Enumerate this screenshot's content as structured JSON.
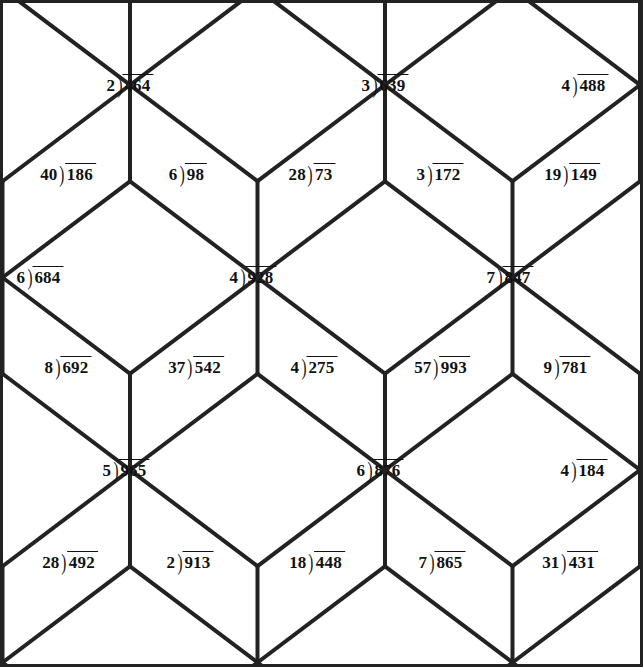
{
  "page": {
    "background_color": "#ffffff",
    "line_color": "#222222",
    "text_color": "#111111",
    "width": 643,
    "height": 667
  },
  "tiling": {
    "type": "rhombille",
    "description": "Cube / rhombille tessellation of 60-120 degree rhombi",
    "hub_spacing_x": 255,
    "hub_spacing_y": 192.5,
    "hub_rows_y": [
      -107.5,
      85,
      277.5,
      470,
      662.5
    ],
    "hub_cols_x": [
      3,
      130,
      258,
      385,
      513,
      640
    ],
    "border_width": 3,
    "line_width": 4
  },
  "problems": [
    {
      "id": "p1",
      "divisor": "2",
      "dividend": "464",
      "x": 130,
      "y": 85,
      "row": 1,
      "col": 1
    },
    {
      "id": "p2",
      "divisor": "3",
      "dividend": "639",
      "x": 385,
      "y": 85,
      "row": 1,
      "col": 2
    },
    {
      "id": "p3",
      "divisor": "4",
      "dividend": "488",
      "x": 585,
      "y": 85,
      "row": 1,
      "col": 3
    },
    {
      "id": "p4",
      "divisor": "40",
      "dividend": "186",
      "x": 68,
      "y": 174,
      "row": 2,
      "col": 1
    },
    {
      "id": "p5",
      "divisor": "6",
      "dividend": "98",
      "x": 188,
      "y": 174,
      "row": 2,
      "col": 2
    },
    {
      "id": "p6",
      "divisor": "28",
      "dividend": "73",
      "x": 312,
      "y": 174,
      "row": 2,
      "col": 3
    },
    {
      "id": "p7",
      "divisor": "3",
      "dividend": "172",
      "x": 440,
      "y": 174,
      "row": 2,
      "col": 4
    },
    {
      "id": "p8",
      "divisor": "19",
      "dividend": "149",
      "x": 572,
      "y": 174,
      "row": 2,
      "col": 5
    },
    {
      "id": "p9",
      "divisor": "6",
      "dividend": "684",
      "x": 40,
      "y": 277,
      "row": 3,
      "col": 1
    },
    {
      "id": "p10",
      "divisor": "4",
      "dividend": "928",
      "x": 253,
      "y": 277,
      "row": 3,
      "col": 2
    },
    {
      "id": "p11",
      "divisor": "7",
      "dividend": "847",
      "x": 510,
      "y": 277,
      "row": 3,
      "col": 3
    },
    {
      "id": "p12",
      "divisor": "8",
      "dividend": "692",
      "x": 68,
      "y": 367,
      "row": 4,
      "col": 1
    },
    {
      "id": "p13",
      "divisor": "37",
      "dividend": "542",
      "x": 196,
      "y": 367,
      "row": 4,
      "col": 2
    },
    {
      "id": "p14",
      "divisor": "4",
      "dividend": "275",
      "x": 314,
      "y": 367,
      "row": 4,
      "col": 3
    },
    {
      "id": "p15",
      "divisor": "57",
      "dividend": "993",
      "x": 442,
      "y": 367,
      "row": 4,
      "col": 4
    },
    {
      "id": "p16",
      "divisor": "9",
      "dividend": "781",
      "x": 567,
      "y": 367,
      "row": 4,
      "col": 5
    },
    {
      "id": "p17",
      "divisor": "5",
      "dividend": "965",
      "x": 126,
      "y": 470,
      "row": 5,
      "col": 1
    },
    {
      "id": "p18",
      "divisor": "6",
      "dividend": "876",
      "x": 380,
      "y": 470,
      "row": 5,
      "col": 2
    },
    {
      "id": "p19",
      "divisor": "4",
      "dividend": "184",
      "x": 584,
      "y": 470,
      "row": 5,
      "col": 3
    },
    {
      "id": "p20",
      "divisor": "28",
      "dividend": "492",
      "x": 70,
      "y": 562,
      "row": 6,
      "col": 1
    },
    {
      "id": "p21",
      "divisor": "2",
      "dividend": "913",
      "x": 190,
      "y": 562,
      "row": 6,
      "col": 2
    },
    {
      "id": "p22",
      "divisor": "18",
      "dividend": "448",
      "x": 317,
      "y": 562,
      "row": 6,
      "col": 3
    },
    {
      "id": "p23",
      "divisor": "7",
      "dividend": "865",
      "x": 442,
      "y": 562,
      "row": 6,
      "col": 4
    },
    {
      "id": "p24",
      "divisor": "31",
      "dividend": "431",
      "x": 570,
      "y": 562,
      "row": 6,
      "col": 5
    }
  ],
  "bracket_glyph": ")"
}
